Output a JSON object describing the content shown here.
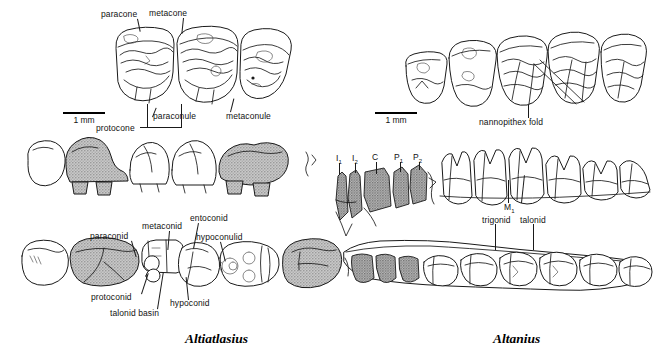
{
  "figure": {
    "background_color": "#ffffff",
    "ink_color": "#1a1a1a",
    "shade_color": "#b0b0b0"
  },
  "panels": [
    {
      "id": "left",
      "taxon": "Altiatlasius",
      "scale_bar": {
        "caption": "1 mm"
      },
      "rows": [
        {
          "id": "upper-molars-oblique",
          "view": "upper molars, oblique occlusal",
          "tooth_count": 3
        },
        {
          "id": "upper-cheek-teeth-buccal",
          "view": "upper cheek teeth, buccal",
          "tooth_count": 5,
          "shaded_positions": [
            2,
            5
          ]
        },
        {
          "id": "lower-molars-occlusal",
          "view": "lower molars, occlusal",
          "tooth_count": 5,
          "shaded_positions": [
            2,
            5
          ]
        }
      ],
      "labels": [
        {
          "id": "paracone",
          "text": "paracone"
        },
        {
          "id": "metacone",
          "text": "metacone"
        },
        {
          "id": "paraconule",
          "text": "paraconule"
        },
        {
          "id": "metaconule",
          "text": "metaconule"
        },
        {
          "id": "protocone",
          "text": "protocone"
        },
        {
          "id": "paraconid",
          "text": "paraconid"
        },
        {
          "id": "metaconid",
          "text": "metaconid"
        },
        {
          "id": "entoconid",
          "text": "entoconid"
        },
        {
          "id": "hypoconulid",
          "text": "hypoconulid"
        },
        {
          "id": "protoconid",
          "text": "protoconid"
        },
        {
          "id": "hypoconid",
          "text": "hypoconid"
        },
        {
          "id": "talonid-basin",
          "text": "talonid basin"
        }
      ]
    },
    {
      "id": "right",
      "taxon": "Altanius",
      "scale_bar": {
        "caption": "1 mm"
      },
      "rows": [
        {
          "id": "lower-molars-oblique",
          "view": "lower molars, oblique occlusal",
          "tooth_count": 5
        },
        {
          "id": "lower-dentition-buccal",
          "view": "lower dentition, buccal",
          "tooth_count": 9
        },
        {
          "id": "mandible-occlusal",
          "view": "mandible with tooth row, occlusal",
          "tooth_count": 9
        }
      ],
      "labels": [
        {
          "id": "nannopithex-fold",
          "text": "nannopithex fold"
        },
        {
          "id": "trigonid",
          "text": "trigonid"
        },
        {
          "id": "talonid",
          "text": "talonid"
        }
      ],
      "tooth_positions": [
        {
          "id": "i1",
          "text": "I",
          "subscript": "1"
        },
        {
          "id": "i2",
          "text": "I",
          "subscript": "2"
        },
        {
          "id": "c",
          "text": "C",
          "subscript": ""
        },
        {
          "id": "p1",
          "text": "P",
          "subscript": "1"
        },
        {
          "id": "p2",
          "text": "P",
          "subscript": "2"
        },
        {
          "id": "m1",
          "text": "M",
          "subscript": "1"
        }
      ]
    }
  ]
}
